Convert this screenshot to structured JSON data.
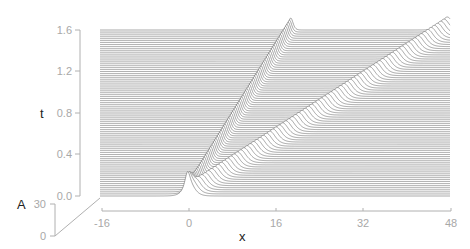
{
  "chart_data": {
    "type": "waterfall",
    "title": "",
    "xlabel": "x",
    "ylabel": "t",
    "zlabel": "A",
    "x_ticks": [
      "-16",
      "0",
      "16",
      "32",
      "48"
    ],
    "x_tick_values": [
      -16,
      0,
      16,
      32,
      48
    ],
    "t_ticks": [
      "0.0",
      "0.4",
      "0.8",
      "1.2",
      "1.6"
    ],
    "t_tick_values": [
      0.0,
      0.4,
      0.8,
      1.2,
      1.6
    ],
    "A_ticks": [
      "0",
      "30"
    ],
    "A_tick_values": [
      0,
      30
    ],
    "xlim": [
      -16,
      48
    ],
    "tlim": [
      0,
      1.6
    ],
    "Alim": [
      0,
      30
    ],
    "num_time_slices": 81,
    "series": [
      {
        "name": "soliton-narrow-tall",
        "x0": 0,
        "speed": 11.8,
        "height_px": 12,
        "width": 0.55
      },
      {
        "name": "soliton-wide",
        "x0": 0.3,
        "speed": 29.5,
        "height_px": 13,
        "width": 1.3
      }
    ],
    "grid": false,
    "legend": "none",
    "line_color": "#6a6a6a",
    "axis_color": "#b0b0b0",
    "tick_label_color": "#a8a8a8"
  }
}
